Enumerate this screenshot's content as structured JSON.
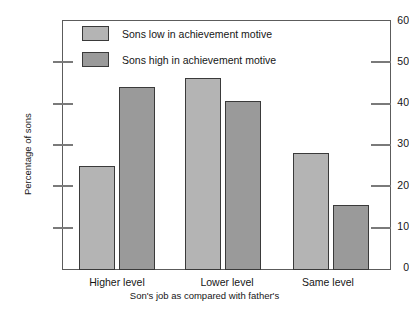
{
  "chart_data": {
    "type": "bar",
    "title": "",
    "xlabel": "Son's job as compared with father's",
    "ylabel": "Percentage of sons",
    "categories": [
      "Higher level",
      "Lower level",
      "Same level"
    ],
    "series": [
      {
        "name": "Sons low in  achievement motive",
        "values": [
          25,
          46,
          28
        ],
        "color": "#b4b4b4"
      },
      {
        "name": "Sons high in  achievement motive",
        "values": [
          44,
          40.5,
          15.5
        ],
        "color": "#9a9a9a"
      }
    ],
    "ylim": [
      0,
      60
    ],
    "yticks": [
      0,
      10,
      20,
      30,
      40,
      50,
      60
    ],
    "ytick_labels": [
      "0",
      "10",
      "20",
      "30",
      "40",
      "50",
      "60"
    ],
    "grid": false,
    "legend_position": "top-left-inside"
  },
  "axis": {
    "y_title": "Percentage of sons",
    "x_title": "Son's job as compared with father's"
  },
  "legend": {
    "items": [
      {
        "label": "Sons low in  achievement motive"
      },
      {
        "label": "Sons high in  achievement motive"
      }
    ]
  }
}
